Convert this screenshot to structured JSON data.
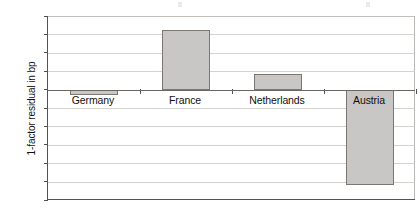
{
  "chart_data": {
    "type": "bar",
    "title": "",
    "xlabel": "",
    "ylabel": "1-factor residual in bp",
    "categories": [
      "Germany",
      "France",
      "Netherlands",
      "Austria"
    ],
    "values": [
      -1.5,
      16.3,
      4.2,
      -26.0
    ],
    "ylim": [
      -30,
      20
    ],
    "yticks": [
      20,
      15,
      10,
      5,
      0,
      -5,
      -10,
      -15,
      -20,
      -25,
      -30
    ],
    "ytick_labels": [
      "20",
      "15",
      "10",
      "5",
      "0",
      "-5",
      "-10",
      "-15",
      "-20",
      "-25",
      "-30"
    ],
    "grid": true,
    "legend": "none",
    "series": [
      {
        "name": "1-factor residual",
        "values": [
          -1.5,
          16.3,
          4.2,
          -26.0
        ],
        "color": "#c9c7c5",
        "edge_color": "#7c7774"
      }
    ],
    "zero_line": 0,
    "bar_width_ratio": 0.52
  },
  "axes": {
    "y_title": "1-factor residual in bp"
  }
}
